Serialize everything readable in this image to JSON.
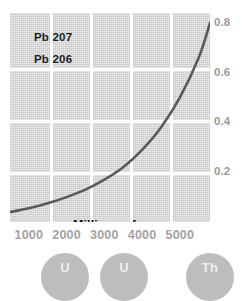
{
  "chart_data": {
    "type": "line",
    "title": "",
    "xlabel": "Millions of years",
    "ylabel": "",
    "xlim": [
      500,
      5800
    ],
    "ylim": [
      0,
      0.84
    ],
    "grid": true,
    "legend_position": "top-left-inside",
    "series_labels": [
      "Pb 207",
      "Pb 206"
    ],
    "series": [
      {
        "name": "Pb 207 / Pb 206 ratio",
        "x": [
          500,
          1000,
          1500,
          2000,
          2500,
          3000,
          3500,
          4000,
          4500,
          5000,
          5500,
          5800
        ],
        "y": [
          0.04,
          0.055,
          0.075,
          0.1,
          0.13,
          0.17,
          0.22,
          0.29,
          0.38,
          0.5,
          0.66,
          0.8
        ]
      }
    ],
    "xticks": [
      1000,
      2000,
      3000,
      4000,
      5000
    ],
    "xtick_labels": [
      "1000",
      "2000",
      "3000",
      "4000",
      "5000"
    ],
    "yticks": [
      0.2,
      0.4,
      0.6,
      0.8
    ],
    "ytick_labels": [
      "0.2",
      "0.4",
      "0.6",
      "0.8"
    ],
    "colors": {
      "panel_background": "#d5d5d5",
      "gridline": "#fdfdfd",
      "curve": "#5a5a5a",
      "series_label_text": "#1d1d1d",
      "tick_text": "#9f9f9f",
      "axis_title_text": "#141414",
      "element_chip": "#bdbdbd",
      "element_chip_text": "#eeeeee"
    }
  },
  "elements": [
    {
      "symbol": "U",
      "x": 65
    },
    {
      "symbol": "U",
      "x": 124
    },
    {
      "symbol": "Th",
      "x": 210
    }
  ]
}
